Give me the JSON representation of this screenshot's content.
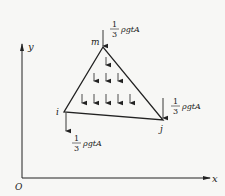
{
  "diagram": {
    "type": "triangular element with body-force nodal loads",
    "nodes": [
      {
        "id": "m",
        "label": "m",
        "x": 103,
        "y": 47
      },
      {
        "id": "i",
        "label": "i",
        "x": 64,
        "y": 112
      },
      {
        "id": "j",
        "label": "j",
        "x": 163,
        "y": 120
      }
    ],
    "nodal_loads": [
      {
        "node": "m",
        "numerator": "1",
        "denominator": "3",
        "expr": "ρgtA"
      },
      {
        "node": "i",
        "numerator": "1",
        "denominator": "3",
        "expr": "ρgtA"
      },
      {
        "node": "j",
        "numerator": "1",
        "denominator": "3",
        "expr": "ρgtA"
      }
    ],
    "axes": {
      "origin_label": "O",
      "x_label": "x",
      "y_label": "y"
    },
    "distributed_load_rows": [
      1,
      3,
      5
    ]
  }
}
